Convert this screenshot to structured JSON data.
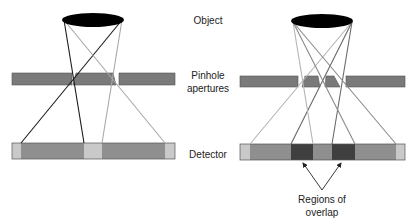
{
  "labels": {
    "object": "Object",
    "pinhole_line1": "Pinhole",
    "pinhole_line2": "apertures",
    "detector": "Detector",
    "overlap_line1": "Regions of",
    "overlap_line2": "overlap"
  },
  "colors": {
    "object": "#000000",
    "aperture_plate": "#7a7a7a",
    "detector_light": "#c9c9c9",
    "detector_mid": "#8f8f8f",
    "detector_overlap": "#3f3f3f",
    "ray_black": "#1a1a1a",
    "ray_gray": "#a8a8a8",
    "ray_darkgray": "#6a6a6a"
  },
  "left_diagram": {
    "description": "Single pinhole pair, no overlap",
    "rays": 4,
    "overlap_regions": 0
  },
  "right_diagram": {
    "description": "Multiple pinholes producing overlapping projections",
    "rays": 6,
    "overlap_regions": 2
  }
}
